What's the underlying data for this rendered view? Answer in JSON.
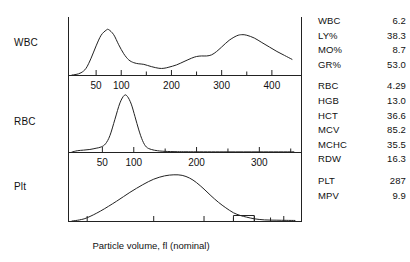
{
  "caption": "Particle volume, fl (nominal)",
  "panels": [
    {
      "id": "wbc",
      "label": "WBC"
    },
    {
      "id": "rbc",
      "label": "RBC"
    },
    {
      "id": "plt",
      "label": "Plt"
    }
  ],
  "results": {
    "groups": [
      {
        "rows": [
          {
            "name": "WBC",
            "value": "6.2"
          },
          {
            "name": "LY%",
            "value": "38.3"
          },
          {
            "name": "MO%",
            "value": "8.7"
          },
          {
            "name": "GR%",
            "value": "53.0"
          }
        ]
      },
      {
        "rows": [
          {
            "name": "RBC",
            "value": "4.29"
          },
          {
            "name": "HGB",
            "value": "13.0"
          },
          {
            "name": "HCT",
            "value": "36.6"
          },
          {
            "name": "MCV",
            "value": "85.2"
          },
          {
            "name": "MCHC",
            "value": "35.5"
          },
          {
            "name": "RDW",
            "value": "16.3"
          }
        ]
      },
      {
        "rows": [
          {
            "name": "PLT",
            "value": "287"
          },
          {
            "name": "MPV",
            "value": "9.9"
          }
        ]
      }
    ]
  },
  "chart_data": {
    "type": "line",
    "title": "",
    "xlabel": "Particle volume, fl (nominal)",
    "ylabel": "",
    "grid": false,
    "legend": "none",
    "stroke_color": "#222222",
    "axis_color": "#222222",
    "panels": [
      {
        "name": "WBC",
        "axis_scale": "linear",
        "xlim": [
          0,
          450
        ],
        "ticks_labeled": [
          50,
          100,
          200,
          300,
          400
        ],
        "ticks_minor": [
          150,
          250,
          350
        ],
        "ylim": [
          0,
          1
        ],
        "description": "Bimodal WBC histogram: lymphocyte peak near 75 fl and granulocyte peak near 340 fl",
        "x": [
          10,
          20,
          30,
          40,
          50,
          60,
          70,
          75,
          85,
          95,
          105,
          115,
          125,
          135,
          145,
          160,
          175,
          185,
          195,
          210,
          225,
          240,
          250,
          260,
          270,
          280,
          290,
          300,
          315,
          330,
          340,
          350,
          365,
          380,
          395,
          410,
          425,
          440
        ],
        "y": [
          0.01,
          0.04,
          0.12,
          0.3,
          0.52,
          0.71,
          0.8,
          0.81,
          0.72,
          0.54,
          0.38,
          0.27,
          0.22,
          0.2,
          0.19,
          0.15,
          0.12,
          0.12,
          0.14,
          0.18,
          0.24,
          0.3,
          0.33,
          0.34,
          0.34,
          0.36,
          0.42,
          0.5,
          0.62,
          0.7,
          0.72,
          0.71,
          0.66,
          0.58,
          0.5,
          0.42,
          0.35,
          0.28
        ]
      },
      {
        "name": "RBC",
        "axis_scale": "linear",
        "xlim": [
          0,
          360
        ],
        "ticks_labeled": [
          50,
          100,
          200,
          300
        ],
        "ticks_minor": [
          150,
          250,
          350
        ],
        "ylim": [
          0,
          1
        ],
        "description": "Single narrow RBC peak near 85 fl with small left shoulder near 45 fl",
        "x": [
          10,
          20,
          30,
          40,
          48,
          55,
          62,
          70,
          78,
          85,
          90,
          96,
          102,
          108,
          114,
          120,
          128,
          138,
          150,
          170,
          200,
          250,
          300,
          355
        ],
        "y": [
          0.02,
          0.03,
          0.04,
          0.06,
          0.08,
          0.13,
          0.26,
          0.52,
          0.78,
          0.9,
          0.88,
          0.76,
          0.56,
          0.35,
          0.18,
          0.08,
          0.04,
          0.02,
          0.01,
          0.005,
          0.003,
          0.002,
          0.002,
          0.002
        ]
      },
      {
        "name": "Plt",
        "axis_scale": "log",
        "xlim": [
          1.6,
          36
        ],
        "ticks_labeled": [
          2,
          5,
          10,
          20,
          30
        ],
        "ticks_minor": [
          15,
          25
        ],
        "ylim": [
          0,
          1
        ],
        "description": "Broad platelet distribution peaking near 7 fl with a flat threshold box between 15 and 20 fl",
        "x": [
          1.8,
          2.0,
          2.4,
          3.0,
          3.6,
          4.3,
          5.0,
          5.8,
          6.6,
          7.4,
          8.2,
          9.0,
          10.0,
          11.0,
          12.2,
          13.5,
          15.0,
          16.5,
          18.0,
          20.0,
          23.0,
          27.0,
          31.0,
          35.0
        ],
        "y": [
          0.02,
          0.06,
          0.18,
          0.36,
          0.52,
          0.66,
          0.76,
          0.82,
          0.84,
          0.83,
          0.78,
          0.7,
          0.58,
          0.46,
          0.34,
          0.24,
          0.15,
          0.1,
          0.07,
          0.04,
          0.02,
          0.015,
          0.012,
          0.01
        ],
        "threshold_box": {
          "from": 15,
          "to": 20,
          "height": 0.1
        }
      }
    ]
  }
}
